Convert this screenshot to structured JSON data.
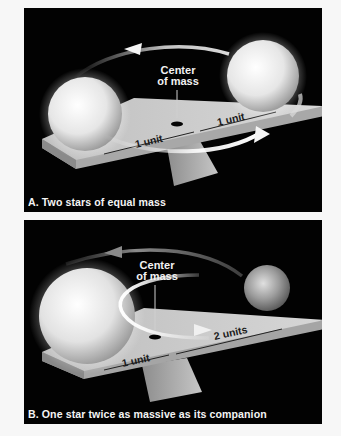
{
  "panels": {
    "a": {
      "caption": "A. Two stars of equal mass",
      "center_label_line1": "Center",
      "center_label_line2": "of mass",
      "left_distance": "1 unit",
      "right_distance": "1 unit"
    },
    "b": {
      "caption": "B. One star twice as massive as its companion",
      "center_label_line1": "Center",
      "center_label_line2": "of mass",
      "left_distance": "1 unit",
      "right_distance": "2 units"
    }
  },
  "colors": {
    "panel_background": "#020202",
    "page_background": "#f7f7f7",
    "beam": "#c9c9c9",
    "text_light": "#f4f4f4"
  }
}
